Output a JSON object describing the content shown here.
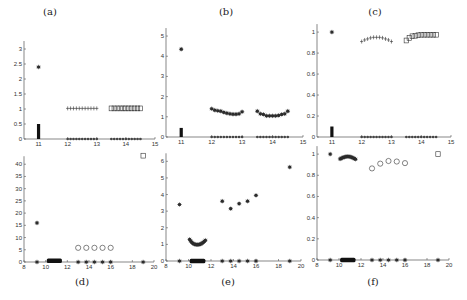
{
  "figure": {
    "panel_labels": [
      "(a)",
      "(b)",
      "(c)",
      "(d)",
      "(e)",
      "(f)"
    ]
  },
  "chart_data": [
    {
      "id": "a",
      "type": "scatter",
      "title": "(a)",
      "xlim": [
        10.5,
        15
      ],
      "ylim": [
        0,
        3.3
      ],
      "xticks": [
        11,
        12,
        13,
        14,
        15
      ],
      "yticks": [
        0,
        0.5,
        1,
        1.5,
        2,
        2.5,
        3
      ],
      "ytick_labels": [
        "0",
        "0.5",
        "1",
        "1.5",
        "2",
        "2.5",
        "3"
      ],
      "series": [
        {
          "name": "star-outlier",
          "marker": "star",
          "x": [
            11
          ],
          "y": [
            2.4
          ]
        },
        {
          "name": "bar-cluster-11",
          "marker": "vbar",
          "x": [
            11
          ],
          "y": [
            0.5
          ]
        },
        {
          "name": "plus-12-13",
          "marker": "plus",
          "x": [
            12.0,
            12.1,
            12.2,
            12.3,
            12.4,
            12.5,
            12.6,
            12.7,
            12.8,
            12.9,
            13.0
          ],
          "y": [
            1.02,
            1.02,
            1.02,
            1.02,
            1.02,
            1.02,
            1.02,
            1.02,
            1.02,
            1.02,
            1.02
          ]
        },
        {
          "name": "squares-14",
          "marker": "square",
          "x": [
            13.5,
            13.6,
            13.7,
            13.8,
            13.9,
            14.0,
            14.1,
            14.2,
            14.3,
            14.4,
            14.5
          ],
          "y": [
            1.02,
            1.02,
            1.02,
            1.02,
            1.02,
            1.02,
            1.02,
            1.02,
            1.02,
            1.02,
            1.02
          ]
        },
        {
          "name": "zeros-12-13",
          "marker": "dot",
          "x": [
            12.0,
            12.1,
            12.2,
            12.3,
            12.4,
            12.5,
            12.6,
            12.7,
            12.8,
            12.9,
            13.0
          ],
          "y": [
            0,
            0,
            0,
            0,
            0,
            0,
            0,
            0,
            0,
            0,
            0
          ]
        },
        {
          "name": "zeros-14",
          "marker": "dot",
          "x": [
            13.5,
            13.6,
            13.7,
            13.8,
            13.9,
            14.0,
            14.1,
            14.2,
            14.3,
            14.4,
            14.5
          ],
          "y": [
            0,
            0,
            0,
            0,
            0,
            0,
            0,
            0,
            0,
            0,
            0
          ]
        }
      ]
    },
    {
      "id": "b",
      "type": "scatter",
      "title": "(b)",
      "xlim": [
        10.5,
        15
      ],
      "ylim": [
        0,
        5.3
      ],
      "xticks": [
        11,
        12,
        13,
        14,
        15
      ],
      "yticks": [
        0,
        1,
        2,
        3,
        4,
        5
      ],
      "ytick_labels": [
        "0",
        "1",
        "2",
        "3",
        "4",
        "5"
      ],
      "series": [
        {
          "name": "star-outlier",
          "marker": "star",
          "x": [
            11
          ],
          "y": [
            4.35
          ]
        },
        {
          "name": "bar-cluster-11",
          "marker": "vbar",
          "x": [
            11
          ],
          "y": [
            0.45
          ]
        },
        {
          "name": "stars-12-13",
          "marker": "star",
          "x": [
            12.0,
            12.1,
            12.2,
            12.3,
            12.4,
            12.5,
            12.6,
            12.7,
            12.8,
            12.9,
            13.0
          ],
          "y": [
            1.4,
            1.33,
            1.3,
            1.28,
            1.22,
            1.18,
            1.15,
            1.13,
            1.13,
            1.15,
            1.25
          ]
        },
        {
          "name": "stars-14",
          "marker": "star",
          "x": [
            13.5,
            13.6,
            13.7,
            13.8,
            13.9,
            14.0,
            14.1,
            14.2,
            14.3,
            14.4,
            14.5
          ],
          "y": [
            1.28,
            1.15,
            1.12,
            1.05,
            1.05,
            1.05,
            1.05,
            1.07,
            1.12,
            1.15,
            1.28
          ]
        },
        {
          "name": "zeros-12-13",
          "marker": "dot",
          "x": [
            12.0,
            12.1,
            12.2,
            12.3,
            12.4,
            12.5,
            12.6,
            12.7,
            12.8,
            12.9,
            13.0
          ],
          "y": [
            0,
            0,
            0,
            0,
            0,
            0,
            0,
            0,
            0,
            0,
            0
          ]
        },
        {
          "name": "zeros-14",
          "marker": "dot",
          "x": [
            13.5,
            13.6,
            13.7,
            13.8,
            13.9,
            14.0,
            14.1,
            14.2,
            14.3,
            14.4,
            14.5
          ],
          "y": [
            0,
            0,
            0,
            0,
            0,
            0,
            0,
            0,
            0,
            0,
            0
          ]
        }
      ]
    },
    {
      "id": "c",
      "type": "scatter",
      "title": "(c)",
      "xlim": [
        10.5,
        15
      ],
      "ylim": [
        0,
        1.02
      ],
      "xticks": [
        11,
        12,
        13,
        14,
        15
      ],
      "yticks": [
        0,
        0.2,
        0.4,
        0.6,
        0.8,
        1
      ],
      "ytick_labels": [
        "0",
        "0.2",
        "0.4",
        "0.6",
        "0.8",
        "1"
      ],
      "series": [
        {
          "name": "star-outlier",
          "marker": "star",
          "x": [
            11
          ],
          "y": [
            1.0
          ]
        },
        {
          "name": "bar-cluster-11",
          "marker": "vbar",
          "x": [
            11
          ],
          "y": [
            0.1
          ]
        },
        {
          "name": "plus-12-13",
          "marker": "plus",
          "x": [
            12.0,
            12.1,
            12.2,
            12.3,
            12.4,
            12.5,
            12.6,
            12.7,
            12.8,
            12.9,
            13.0
          ],
          "y": [
            0.91,
            0.925,
            0.935,
            0.945,
            0.95,
            0.95,
            0.95,
            0.945,
            0.935,
            0.925,
            0.91
          ]
        },
        {
          "name": "squares-14",
          "marker": "square",
          "x": [
            13.5,
            13.6,
            13.7,
            13.8,
            13.9,
            14.0,
            14.1,
            14.2,
            14.3,
            14.4,
            14.5
          ],
          "y": [
            0.92,
            0.945,
            0.96,
            0.965,
            0.97,
            0.975,
            0.975,
            0.975,
            0.975,
            0.975,
            0.975
          ]
        },
        {
          "name": "zeros-12-13",
          "marker": "dot",
          "x": [
            12.0,
            12.1,
            12.2,
            12.3,
            12.4,
            12.5,
            12.6,
            12.7,
            12.8,
            12.9,
            13.0
          ],
          "y": [
            0,
            0,
            0,
            0,
            0,
            0,
            0,
            0,
            0,
            0,
            0
          ]
        },
        {
          "name": "zeros-14",
          "marker": "dot",
          "x": [
            13.5,
            13.6,
            13.7,
            13.8,
            13.9,
            14.0,
            14.1,
            14.2,
            14.3,
            14.4,
            14.5
          ],
          "y": [
            0,
            0,
            0,
            0,
            0,
            0,
            0,
            0,
            0,
            0,
            0
          ]
        }
      ]
    },
    {
      "id": "d",
      "type": "scatter",
      "title": "(d)",
      "xlim": [
        8,
        20
      ],
      "ylim": [
        0,
        45
      ],
      "xticks": [
        8,
        10,
        12,
        14,
        16,
        18,
        20
      ],
      "yticks": [
        0,
        5,
        10,
        15,
        20,
        25,
        30,
        35,
        40
      ],
      "ytick_labels": [
        "0",
        "5",
        "10",
        "15",
        "20",
        "25",
        "30",
        "35",
        "40"
      ],
      "series": [
        {
          "name": "star-outlier",
          "marker": "star",
          "x": [
            9.2
          ],
          "y": [
            16
          ]
        },
        {
          "name": "hbar-cluster",
          "marker": "hbar",
          "x": [
            10.1,
            11.5
          ],
          "y": [
            0.5
          ]
        },
        {
          "name": "circles",
          "marker": "circle",
          "x": [
            13,
            13.75,
            14.5,
            15.25,
            16
          ],
          "y": [
            5.8,
            5.8,
            5.8,
            5.8,
            5.8
          ]
        },
        {
          "name": "square-outlier",
          "marker": "square",
          "x": [
            19
          ],
          "y": [
            43.5
          ]
        },
        {
          "name": "zeros",
          "marker": "star",
          "x": [
            9.2,
            13,
            13.75,
            14.5,
            15.25,
            16,
            19
          ],
          "y": [
            0,
            0,
            0,
            0,
            0,
            0,
            0
          ]
        }
      ]
    },
    {
      "id": "e",
      "type": "scatter",
      "title": "(e)",
      "xlim": [
        8,
        20
      ],
      "ylim": [
        0,
        6.5
      ],
      "xticks": [
        8,
        10,
        12,
        14,
        16,
        18,
        20
      ],
      "yticks": [
        0,
        1,
        2,
        3,
        4,
        5,
        6
      ],
      "ytick_labels": [
        "0",
        "1",
        "2",
        "3",
        "4",
        "5",
        "6"
      ],
      "series": [
        {
          "name": "star-outlier",
          "marker": "star",
          "x": [
            9.2
          ],
          "y": [
            3.4
          ]
        },
        {
          "name": "arc-cluster",
          "marker": "star",
          "x": [
            10.1,
            10.2,
            10.3,
            10.4,
            10.5,
            10.6,
            10.7,
            10.8,
            10.9,
            11.0,
            11.1,
            11.2,
            11.3,
            11.4,
            11.5
          ],
          "y": [
            1.3,
            1.2,
            1.12,
            1.06,
            1.02,
            1.0,
            0.98,
            0.98,
            0.99,
            1.0,
            1.03,
            1.07,
            1.12,
            1.18,
            1.25
          ]
        },
        {
          "name": "hbar-cluster",
          "marker": "hbar",
          "x": [
            10.1,
            11.5
          ],
          "y": [
            0
          ]
        },
        {
          "name": "stars-right",
          "marker": "star",
          "x": [
            13,
            13.75,
            14.5,
            15.25,
            16,
            19
          ],
          "y": [
            3.6,
            3.15,
            3.45,
            3.6,
            3.95,
            5.65
          ]
        },
        {
          "name": "zeros",
          "marker": "star",
          "x": [
            9.2,
            13,
            13.75,
            14.5,
            15.25,
            16,
            19
          ],
          "y": [
            0,
            0,
            0,
            0,
            0,
            0,
            0
          ]
        }
      ]
    },
    {
      "id": "f",
      "type": "scatter",
      "title": "(f)",
      "xlim": [
        8,
        20
      ],
      "ylim": [
        0,
        1.02
      ],
      "xticks": [
        8,
        10,
        12,
        14,
        16,
        18,
        20
      ],
      "yticks": [
        0,
        0.2,
        0.4,
        0.6,
        0.8,
        1
      ],
      "ytick_labels": [
        "0",
        "0.2",
        "0.4",
        "0.6",
        "0.8",
        "1"
      ],
      "series": [
        {
          "name": "star-outlier",
          "marker": "star",
          "x": [
            9.2
          ],
          "y": [
            1.0
          ]
        },
        {
          "name": "arc-cluster",
          "marker": "star",
          "x": [
            10.1,
            10.2,
            10.3,
            10.4,
            10.5,
            10.6,
            10.7,
            10.8,
            10.9,
            11.0,
            11.1,
            11.2,
            11.3,
            11.4,
            11.5
          ],
          "y": [
            0.955,
            0.96,
            0.965,
            0.97,
            0.972,
            0.975,
            0.977,
            0.978,
            0.977,
            0.975,
            0.972,
            0.968,
            0.963,
            0.958,
            0.952
          ]
        },
        {
          "name": "hbar-cluster",
          "marker": "hbar",
          "x": [
            10.1,
            11.5
          ],
          "y": [
            0
          ]
        },
        {
          "name": "circles",
          "marker": "circle",
          "x": [
            13,
            13.75,
            14.5,
            15.25,
            16
          ],
          "y": [
            0.865,
            0.91,
            0.935,
            0.93,
            0.915
          ]
        },
        {
          "name": "square-outlier",
          "marker": "square",
          "x": [
            19
          ],
          "y": [
            1.0
          ]
        },
        {
          "name": "zeros",
          "marker": "star",
          "x": [
            9.2,
            13,
            13.75,
            14.5,
            15.25,
            16,
            19
          ],
          "y": [
            0,
            0,
            0,
            0,
            0,
            0,
            0
          ]
        }
      ]
    }
  ],
  "layout": {
    "panels": [
      {
        "id": "a",
        "x0": 24,
        "x1": 155,
        "y0": 139,
        "y1": 40,
        "title_x": 40,
        "title_y": 7,
        "label_pos": "top"
      },
      {
        "id": "b",
        "x0": 166,
        "x1": 303,
        "y0": 137,
        "y1": 30,
        "title_x": 216,
        "title_y": 7,
        "label_pos": "top"
      },
      {
        "id": "c",
        "x0": 317,
        "x1": 451,
        "y0": 137,
        "y1": 30,
        "title_x": 365,
        "title_y": 7,
        "label_pos": "top"
      },
      {
        "id": "d",
        "x0": 24,
        "x1": 154,
        "y0": 262,
        "y1": 152,
        "title_x": 72,
        "title_y": 278,
        "label_pos": "bottom"
      },
      {
        "id": "e",
        "x0": 166,
        "x1": 301,
        "y0": 261,
        "y1": 153,
        "title_x": 218,
        "title_y": 278,
        "label_pos": "bottom"
      },
      {
        "id": "f",
        "x0": 317,
        "x1": 449,
        "y0": 260,
        "y1": 152,
        "title_x": 363,
        "title_y": 278,
        "label_pos": "bottom"
      }
    ]
  }
}
